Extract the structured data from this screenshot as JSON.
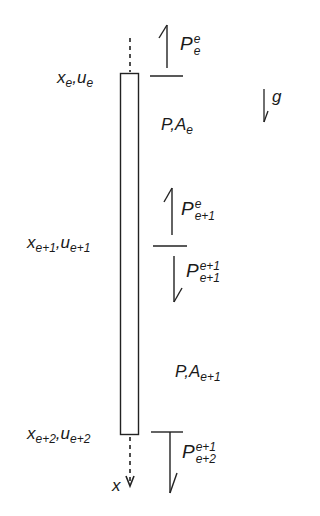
{
  "diagram": {
    "type": "bar-element-force-diagram",
    "nodes": [
      {
        "id": "top",
        "x_label": "x",
        "x_sub": "e",
        "u_label": "u",
        "u_sub": "e"
      },
      {
        "id": "mid",
        "x_label": "x",
        "x_sub": "e+1",
        "u_label": "u",
        "u_sub": "e+1"
      },
      {
        "id": "bottom",
        "x_label": "x",
        "x_sub": "e+2",
        "u_label": "u",
        "u_sub": "e+2"
      }
    ],
    "elements": [
      {
        "id": "element-e",
        "label_P": "P",
        "label_A": "A",
        "sub": "e"
      },
      {
        "id": "element-e1",
        "label_P": "P",
        "label_A": "A",
        "sub": "e+1"
      }
    ],
    "forces": [
      {
        "id": "Pe_e",
        "symbol": "P",
        "sup": "e",
        "sub": "e",
        "direction": "up"
      },
      {
        "id": "Pe_e1",
        "symbol": "P",
        "sup": "e",
        "sub": "e+1",
        "direction": "up"
      },
      {
        "id": "Pe1_e1",
        "symbol": "P",
        "sup": "e+1",
        "sub": "e+1",
        "direction": "down"
      },
      {
        "id": "Pe1_e2",
        "symbol": "P",
        "sup": "e+1",
        "sub": "e+2",
        "direction": "down"
      }
    ],
    "gravity": {
      "symbol": "g",
      "direction": "down"
    },
    "axis": {
      "symbol": "x",
      "direction": "down"
    },
    "separator": ","
  }
}
